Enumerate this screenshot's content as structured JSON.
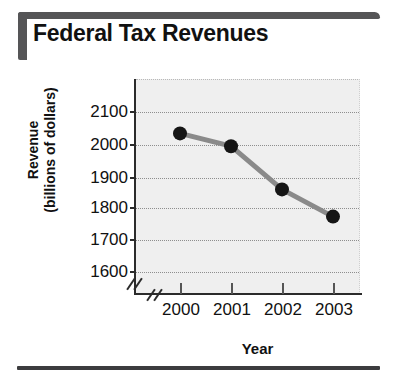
{
  "figure": {
    "title": "Federal Tax Revenues"
  },
  "chart_data": {
    "type": "line",
    "title": "Federal Tax Revenues",
    "xlabel": "Year",
    "ylabel": "Revenue (billions of dollars)",
    "ylabel_line1": "Revenue",
    "ylabel_line2": "(billions of dollars)",
    "categories": [
      "2000",
      "2001",
      "2002",
      "2003"
    ],
    "values": [
      2030,
      1990,
      1855,
      1770
    ],
    "series": [
      {
        "name": "Federal Tax Revenues",
        "values": [
          2030,
          1990,
          1855,
          1770
        ]
      }
    ],
    "ylim": [
      1550,
      2140
    ],
    "yticks": [
      2100,
      2000,
      1900,
      1800,
      1700,
      1600
    ],
    "ytick_labels": [
      "2100",
      "2000",
      "1900",
      "1800",
      "1700",
      "1600"
    ],
    "xtick_labels": [
      "2000",
      "2001",
      "2002",
      "2003"
    ],
    "grid": true,
    "grid_style": "dotted-horizontal",
    "legend": "none",
    "axis_break_x": true,
    "axis_break_y": true,
    "marker": "filled-circle",
    "line_color": "#8a8a8a",
    "marker_color": "#151515",
    "plot_background": "#efefef"
  }
}
